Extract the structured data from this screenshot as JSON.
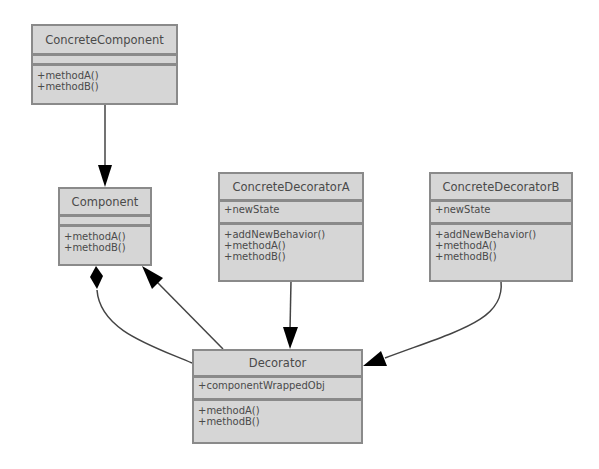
{
  "diagram": {
    "type": "uml-class-diagram",
    "classes": {
      "concrete_component": {
        "name": "ConcreteComponent",
        "attributes": [],
        "methods": [
          "+methodA()",
          "+methodB()"
        ]
      },
      "component": {
        "name": "Component",
        "attributes": [],
        "methods": [
          "+methodA()",
          "+methodB()"
        ]
      },
      "concrete_decorator_a": {
        "name": "ConcreteDecoratorA",
        "attributes": [
          "+newState"
        ],
        "methods": [
          "+addNewBehavior()",
          "+methodA()",
          "+methodB()"
        ]
      },
      "concrete_decorator_b": {
        "name": "ConcreteDecoratorB",
        "attributes": [
          "+newState"
        ],
        "methods": [
          "+addNewBehavior()",
          "+methodA()",
          "+methodB()"
        ]
      },
      "decorator": {
        "name": "Decorator",
        "attributes": [
          "+componentWrappedObj"
        ],
        "methods": [
          "+methodA()",
          "+methodB()"
        ]
      }
    },
    "relations": [
      {
        "from": "ConcreteComponent",
        "to": "Component",
        "type": "inheritance"
      },
      {
        "from": "Decorator",
        "to": "Component",
        "type": "inheritance"
      },
      {
        "from": "Decorator",
        "to": "Component",
        "type": "composition"
      },
      {
        "from": "ConcreteDecoratorA",
        "to": "Decorator",
        "type": "inheritance"
      },
      {
        "from": "ConcreteDecoratorB",
        "to": "Decorator",
        "type": "inheritance"
      }
    ],
    "colors": {
      "box_fill": "#d6d6d6",
      "box_border": "#8a8a8a",
      "text": "#4a4a4a",
      "edge": "#333333",
      "arrowhead": "#000000"
    }
  }
}
